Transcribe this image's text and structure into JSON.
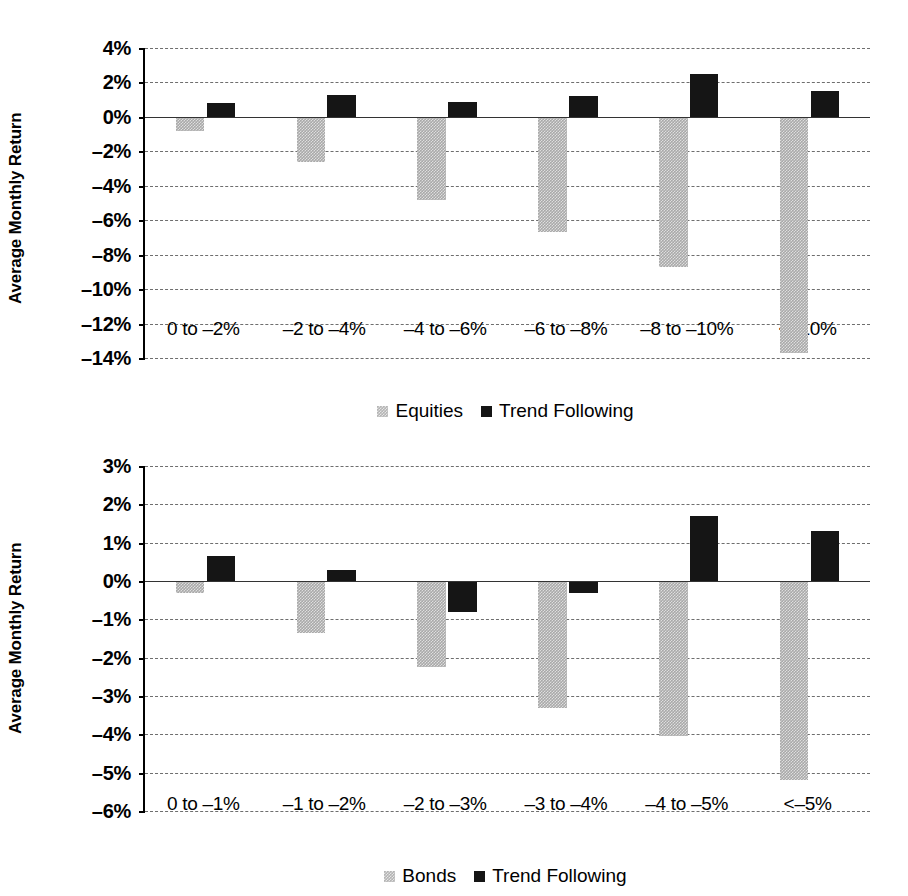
{
  "chart_data": [
    {
      "type": "bar",
      "title": "",
      "xlabel": "",
      "ylabel": "Average Monthly Return",
      "categories": [
        "0 to –2%",
        "–2 to –4%",
        "–4 to –6%",
        "–6 to –8%",
        "–8 to –10%",
        "<–10%"
      ],
      "series": [
        {
          "name": "Equities",
          "color": "#a9a9a9",
          "values": [
            -0.8,
            -2.6,
            -4.8,
            -6.7,
            -8.7,
            -13.7
          ]
        },
        {
          "name": "Trend Following",
          "color": "#151515",
          "values": [
            0.8,
            1.25,
            0.85,
            1.2,
            2.5,
            1.5
          ]
        }
      ],
      "ylim": [
        -14,
        4
      ],
      "yticks": [
        4,
        2,
        0,
        -2,
        -4,
        -6,
        -8,
        -10,
        -12,
        -14
      ],
      "ytick_labels": [
        "4%",
        "2%",
        "0%",
        "–2%",
        "–4%",
        "–6%",
        "–8%",
        "–10%",
        "–12%",
        "–14%"
      ],
      "grid": true,
      "legend_position": "bottom"
    },
    {
      "type": "bar",
      "title": "",
      "xlabel": "",
      "ylabel": "Average Monthly Return",
      "categories": [
        "0 to –1%",
        "–1 to –2%",
        "–2 to –3%",
        "–3 to –4%",
        "–4 to –5%",
        "<–5%"
      ],
      "series": [
        {
          "name": "Bonds",
          "color": "#a9a9a9",
          "values": [
            -0.3,
            -1.35,
            -2.25,
            -3.3,
            -4.05,
            -5.2
          ]
        },
        {
          "name": "Trend Following",
          "color": "#151515",
          "values": [
            0.65,
            0.3,
            -0.8,
            -0.3,
            1.7,
            1.3
          ]
        }
      ],
      "ylim": [
        -6,
        3
      ],
      "yticks": [
        3,
        2,
        1,
        0,
        -1,
        -2,
        -3,
        -4,
        -5,
        -6
      ],
      "ytick_labels": [
        "3%",
        "2%",
        "1%",
        "0%",
        "–1%",
        "–2%",
        "–3%",
        "–4%",
        "–5%",
        "–6%"
      ],
      "grid": true,
      "legend_position": "bottom"
    }
  ]
}
